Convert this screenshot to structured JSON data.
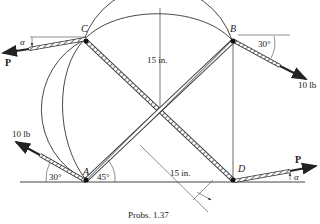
{
  "figure": {
    "caption": "Probs. 1.37",
    "points": {
      "A": {
        "label": "A"
      },
      "B": {
        "label": "B"
      },
      "C": {
        "label": "C"
      },
      "D": {
        "label": "D"
      }
    },
    "dimensions": {
      "vertical": "15 in.",
      "diagonal": "15 in."
    },
    "angles": {
      "left_force_angle": "30°",
      "A_rope_angle": "45°",
      "B_force_angle": "30°",
      "C_alpha": "α",
      "D_alpha": "α"
    },
    "forces": {
      "left_force": "10 lb",
      "right_force": "10 lb",
      "P_left": "P",
      "P_right": "P"
    }
  },
  "colors": {
    "line": "#333333",
    "rope_fill": "#ffffff",
    "text": "#222222"
  }
}
